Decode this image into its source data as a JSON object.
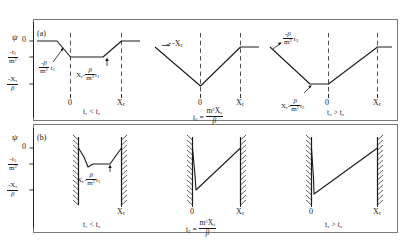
{
  "figure": {
    "title": "",
    "type": "diagram",
    "panels": [
      {
        "id": "a",
        "tag": "(a)",
        "y_axis": {
          "symbol": "ψ",
          "ticks": [
            "0",
            "-t₁/m²",
            "-Xε/β"
          ]
        },
        "subpanels": [
          {
            "key": "a1",
            "x_ticks": [
              "0",
              "Xε"
            ],
            "condition": "t₁ < t₂",
            "annotations": [
              {
                "key": "slope_left",
                "text": "-β/m² t₁"
              },
              {
                "key": "plateau",
                "text": "Xε - β/m² t₁"
              }
            ]
          },
          {
            "key": "a2",
            "x_ticks": [
              "0",
              "Xε"
            ],
            "condition": "t₂ = m²Xε/β",
            "annotations": [
              {
                "key": "apex",
                "text": "-Xε"
              }
            ]
          },
          {
            "key": "a3",
            "x_ticks": [
              "Xε - β/m² t₃",
              "0",
              "Xε"
            ],
            "condition": "t₃ > t₂",
            "annotations": [
              {
                "key": "slope_left",
                "text": "-β/m² t₃"
              }
            ]
          }
        ]
      },
      {
        "id": "b",
        "tag": "(b)",
        "y_axis": {
          "symbol": "ψ",
          "ticks": [
            "0",
            "-t₁/m²",
            "-Xε/β"
          ]
        },
        "subpanels": [
          {
            "key": "b1",
            "x_ticks": [
              "Xε"
            ],
            "condition": "t₁ < t₂",
            "annotations": [
              {
                "key": "plateau",
                "text": "Xε - β/m² t₁"
              }
            ]
          },
          {
            "key": "b2",
            "x_ticks": [
              "0",
              "Xε"
            ],
            "condition": "t₂ = m²Xε/β",
            "annotations": []
          },
          {
            "key": "b3",
            "x_ticks": [
              "0",
              "Xε"
            ],
            "condition": "t₃ > t₂",
            "annotations": []
          }
        ]
      }
    ],
    "colors": {
      "line": "#1a1a1a",
      "frame": "#6b6b6b",
      "dashed": "#3c3c3c",
      "background": "#ffffff"
    },
    "symbols": {
      "psi": "ψ",
      "beta": "β",
      "epsilon": "ε",
      "m2": "m²"
    }
  }
}
